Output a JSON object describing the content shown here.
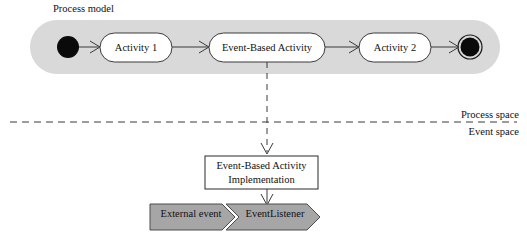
{
  "diagram": {
    "title_caption": "Process model",
    "process_band": {
      "label": "Process model",
      "fill_color": "#d9d9d9"
    },
    "nodes": {
      "initial_node": "initial-node",
      "activity_1": "Activity 1",
      "event_based_activity": "Event-Based Activity",
      "activity_2": "Activity 2",
      "final_node": "final-node"
    },
    "separator": {
      "above_label": "Process space",
      "below_label": "Event space"
    },
    "implementation_box": {
      "line_1": "Event-Based Activity",
      "line_2": "Implementation",
      "fill_color": "#ffffff",
      "stroke_color": "#2b2b2b"
    },
    "event_shapes": {
      "external_event": "External event",
      "event_listener": "EventListener",
      "fill_color": "#a6a6a6",
      "stroke_color": "#4d4d4d"
    },
    "colors": {
      "line": "#3a3a3a",
      "text": "#111111",
      "node_fill": "#000000",
      "activity_fill": "#ffffff"
    }
  }
}
